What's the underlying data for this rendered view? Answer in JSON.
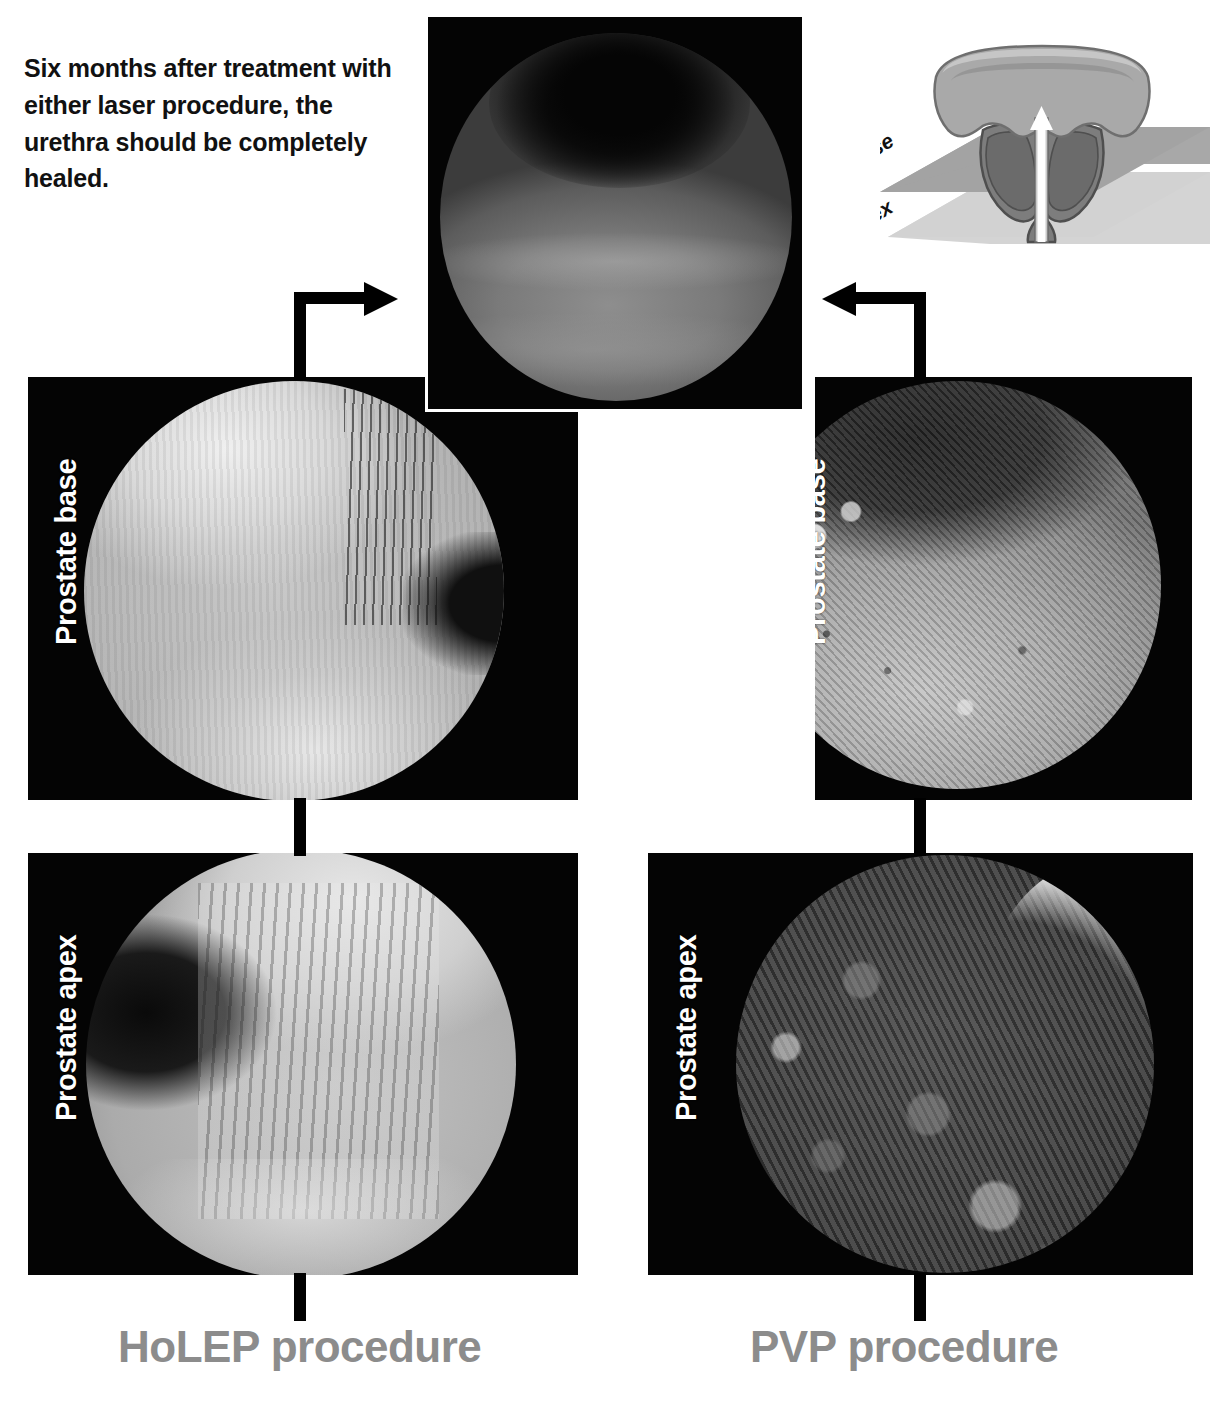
{
  "caption": {
    "text": "Six months after treatment with either laser procedure, the urethra should be completely healed."
  },
  "diagram": {
    "name": "prostate-base-apex-planes",
    "plane_labels": [
      "Base",
      "Apex"
    ],
    "arrow": "urethra-direction-arrow",
    "colors": {
      "bladder": "#a9a9a9",
      "prostate": "#7d7d7d",
      "plane_base": "#9e9e9e",
      "plane_apex": "#cfcfcf",
      "arrow": "#ffffff",
      "outline": "#555555"
    }
  },
  "panels": {
    "healed": {
      "name": "healed-urethra-endoscopic-view",
      "caption_ref": "Six months after treatment"
    },
    "holep_base": {
      "label": "Prostate base"
    },
    "holep_apex": {
      "label": "Prostate apex"
    },
    "pvp_base": {
      "label": "Prostate base"
    },
    "pvp_apex": {
      "label": "Prostate apex"
    }
  },
  "procedures": {
    "left": {
      "label": "HoLEP procedure",
      "color": "#8c8c8c"
    },
    "right": {
      "label": "PVP procedure",
      "color": "#8c8c8c"
    }
  }
}
